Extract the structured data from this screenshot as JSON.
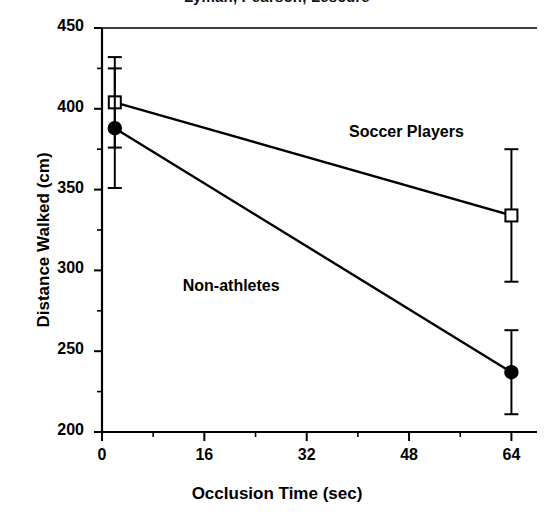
{
  "chart_data": {
    "type": "line",
    "title": "Lyman, Pearson, Lescure",
    "xlabel": "Occlusion Time (sec)",
    "ylabel": "Distance Walked (cm)",
    "xlim": [
      0,
      68
    ],
    "ylim": [
      200,
      450
    ],
    "xticks": [
      0,
      16,
      32,
      48,
      64
    ],
    "xtick_labels": [
      "0",
      "16",
      "32",
      "48",
      "64"
    ],
    "xminor_ticks": [
      8,
      24,
      40,
      56
    ],
    "yticks": [
      200,
      250,
      300,
      350,
      400,
      450
    ],
    "ytick_labels": [
      "200",
      "250",
      "300",
      "350",
      "400",
      "450"
    ],
    "yminor_ticks": [
      225,
      275,
      325,
      375,
      425
    ],
    "grid": false,
    "legend_position": "in-plot-annotations",
    "x": [
      2,
      64
    ],
    "series": [
      {
        "name": "Soccer Players",
        "marker": "open-square",
        "values": [
          404,
          334
        ],
        "yerr_upper": [
          28,
          41
        ],
        "yerr_lower": [
          28,
          41
        ],
        "label_x": 48,
        "label_y": 385
      },
      {
        "name": "Non-athletes",
        "marker": "filled-circle",
        "values": [
          388,
          237
        ],
        "yerr_upper": [
          37,
          26
        ],
        "yerr_lower": [
          37,
          26
        ],
        "label_x": 22,
        "label_y": 290
      }
    ],
    "annotations": [
      {
        "text": "Soccer Players",
        "x": 48,
        "y": 385
      },
      {
        "text": "Non-athletes",
        "x": 22,
        "y": 290
      }
    ],
    "colors": {
      "axis": "#000000",
      "series_soccer": "#000000",
      "series_nonathletes": "#000000",
      "background": "#ffffff"
    }
  }
}
